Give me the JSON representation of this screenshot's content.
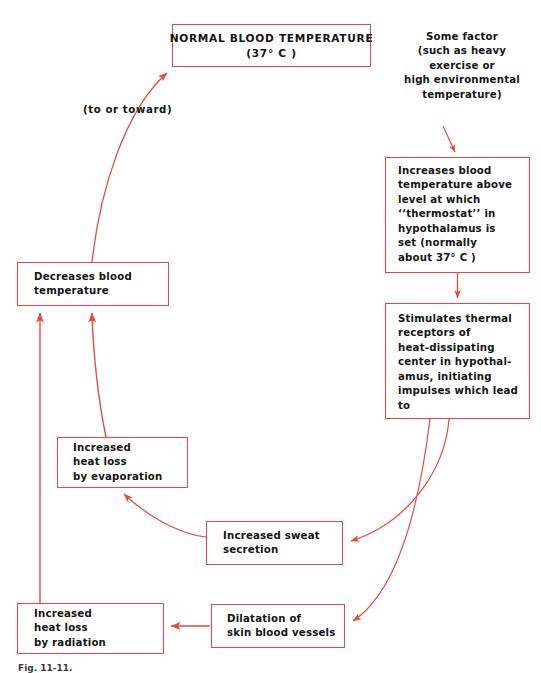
{
  "diagram": {
    "colors": {
      "box_border": "#ef4343",
      "arrow": "#e8493f",
      "text": "#141414",
      "background": "#ffffff"
    },
    "caption": "Fig. 11-11.",
    "nodes": {
      "normal_temperature": {
        "lines": [
          "NORMAL BLOOD TEMPERATURE",
          "(37° C )"
        ]
      },
      "some_factor": {
        "lines": [
          "Some factor",
          "(such as heavy",
          "exercise or",
          "high environmental",
          "temperature)"
        ]
      },
      "increases_blood_temperature": {
        "lines": [
          "Increases blood",
          "temperature above",
          "level at which",
          "‘‘thermostat’’ in",
          "hypothalamus is",
          "set (normally",
          "about 37° C )"
        ]
      },
      "stimulates_thermal_receptors": {
        "lines": [
          "Stimulates thermal",
          "receptors of",
          "heat-dissipating",
          "center in hypothal-",
          "amus, initiating",
          "impulses which lead",
          "to"
        ]
      },
      "decreases_blood_temperature": {
        "lines": [
          "Decreases blood",
          "temperature"
        ]
      },
      "increased_heat_loss_evaporation": {
        "lines": [
          "Increased",
          "heat loss",
          "by evaporation"
        ]
      },
      "increased_sweat_secretion": {
        "lines": [
          "Increased sweat",
          "secretion"
        ]
      },
      "dilatation_skin_blood_vessels": {
        "lines": [
          "Dilatation of",
          "skin blood vessels"
        ]
      },
      "increased_heat_loss_radiation": {
        "lines": [
          "Increased",
          "heat loss",
          "by radiation"
        ]
      }
    },
    "labels": {
      "to_or_toward": "(to or toward)"
    },
    "edges": [
      {
        "name": "some-factor-to-increases",
        "from": "some_factor",
        "to": "increases_blood_temperature"
      },
      {
        "name": "increases-to-stimulates",
        "from": "increases_blood_temperature",
        "to": "stimulates_thermal_receptors"
      },
      {
        "name": "stimulates-to-sweat",
        "from": "stimulates_thermal_receptors",
        "to": "increased_sweat_secretion"
      },
      {
        "name": "stimulates-to-dilatation",
        "from": "stimulates_thermal_receptors",
        "to": "dilatation_skin_blood_vessels"
      },
      {
        "name": "sweat-to-evaporation",
        "from": "increased_sweat_secretion",
        "to": "increased_heat_loss_evaporation"
      },
      {
        "name": "dilatation-to-radiation",
        "from": "dilatation_skin_blood_vessels",
        "to": "increased_heat_loss_radiation"
      },
      {
        "name": "evaporation-to-decreases",
        "from": "increased_heat_loss_evaporation",
        "to": "decreases_blood_temperature"
      },
      {
        "name": "radiation-to-decreases",
        "from": "increased_heat_loss_radiation",
        "to": "decreases_blood_temperature"
      },
      {
        "name": "decreases-to-normal",
        "from": "decreases_blood_temperature",
        "to": "normal_temperature",
        "label": "(to or toward)"
      }
    ]
  }
}
